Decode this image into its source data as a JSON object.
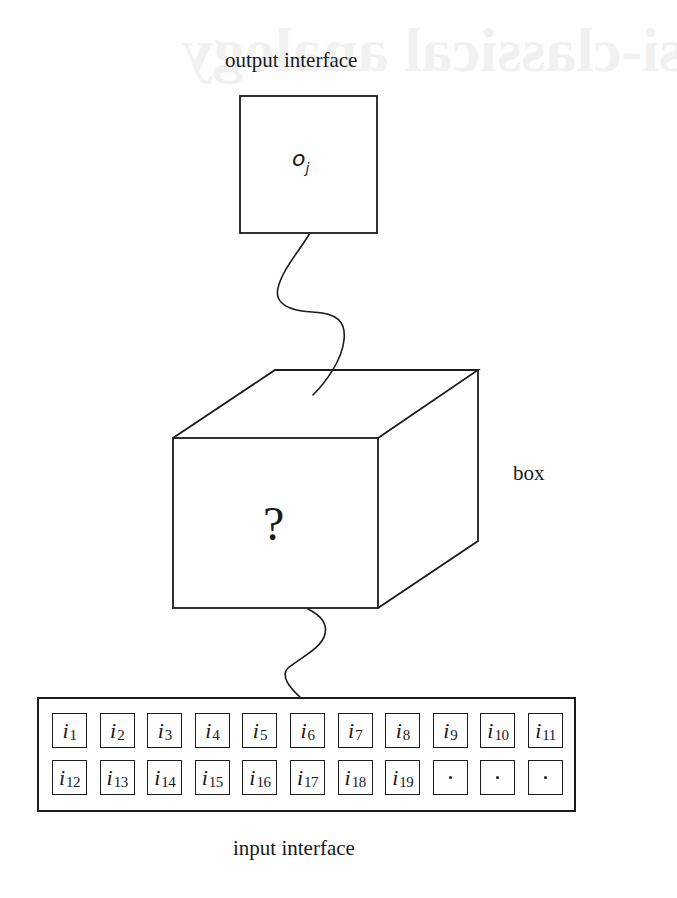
{
  "figure": {
    "labels": {
      "output_interface": "output interface",
      "input_interface": "input interface",
      "box": "box",
      "unknown": "?"
    },
    "output_box": {
      "symbol": "o",
      "subscript": "j"
    },
    "input_cells": {
      "row1": [
        {
          "symbol": "i",
          "subscript": "1"
        },
        {
          "symbol": "i",
          "subscript": "2"
        },
        {
          "symbol": "i",
          "subscript": "3"
        },
        {
          "symbol": "i",
          "subscript": "4"
        },
        {
          "symbol": "i",
          "subscript": "5"
        },
        {
          "symbol": "i",
          "subscript": "6"
        },
        {
          "symbol": "i",
          "subscript": "7"
        },
        {
          "symbol": "i",
          "subscript": "8"
        },
        {
          "symbol": "i",
          "subscript": "9"
        },
        {
          "symbol": "i",
          "subscript": "10"
        },
        {
          "symbol": "i",
          "subscript": "11"
        }
      ],
      "row2": [
        {
          "symbol": "i",
          "subscript": "12"
        },
        {
          "symbol": "i",
          "subscript": "13"
        },
        {
          "symbol": "i",
          "subscript": "14"
        },
        {
          "symbol": "i",
          "subscript": "15"
        },
        {
          "symbol": "i",
          "subscript": "16"
        },
        {
          "symbol": "i",
          "subscript": "17"
        },
        {
          "symbol": "i",
          "subscript": "18"
        },
        {
          "symbol": "i",
          "subscript": "19"
        },
        {
          "symbol": "·",
          "subscript": ""
        },
        {
          "symbol": "·",
          "subscript": ""
        },
        {
          "symbol": "·",
          "subscript": ""
        }
      ]
    },
    "bleed_through_text": "Quasi-classical analogy",
    "colors": {
      "ink": "#1c1c1c",
      "paper": "#ffffff"
    }
  }
}
